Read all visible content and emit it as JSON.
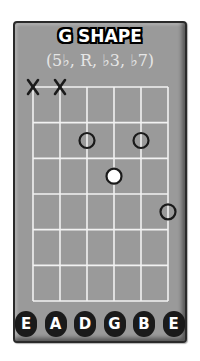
{
  "diagram": {
    "title": "G SHAPE",
    "formula": "(5♭, R, ♭3, ♭7)",
    "strings": [
      "E",
      "A",
      "D",
      "G",
      "B",
      "E"
    ],
    "frets_shown": 6,
    "muted_strings": [
      1,
      2
    ],
    "notes": [
      {
        "string": 3,
        "fret": 2,
        "style": "open-circle"
      },
      {
        "string": 5,
        "fret": 2,
        "style": "open-circle"
      },
      {
        "string": 4,
        "fret": 3,
        "style": "filled-white",
        "is_root": true
      },
      {
        "string": 6,
        "fret": 4,
        "style": "open-circle"
      }
    ],
    "colors": {
      "card": "#9a9a9a",
      "grid": "#f2f2f2",
      "marker": "#1a1a1a",
      "root_fill": "#ffffff"
    }
  }
}
